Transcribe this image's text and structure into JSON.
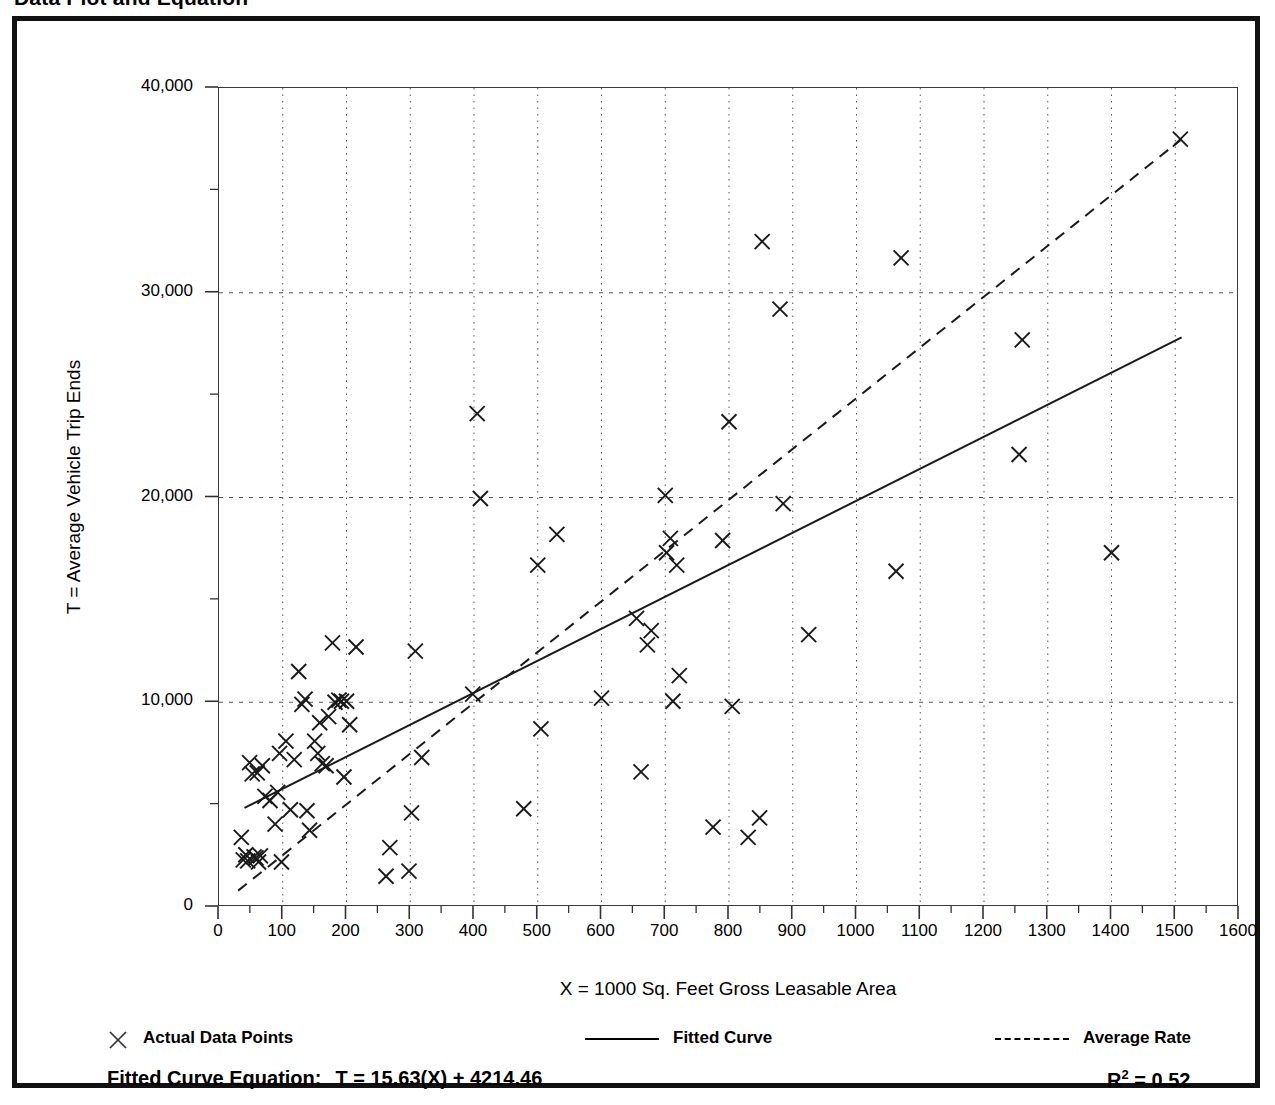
{
  "figure": {
    "title": "Data Plot and Equation"
  },
  "legend": [
    {
      "name": "actual-data-points",
      "label": "Actual Data Points",
      "swatch": "marker",
      "x": 0
    },
    {
      "name": "fitted-curve",
      "label": "Fitted Curve",
      "swatch": "solid",
      "x": 478
    },
    {
      "name": "average-rate",
      "label": "Average Rate",
      "swatch": "dashed",
      "x": 888
    }
  ],
  "equation": {
    "label": "Fitted Curve Equation:",
    "value": "T = 15.63(X) + 4214.46",
    "r_squared_symbol": "R",
    "r_squared_exponent": "2",
    "r_squared_value": "= 0.52"
  },
  "chart_data": {
    "type": "scatter",
    "title": "Data Plot and Equation",
    "xlabel": "X = 1000 Sq. Feet Gross Leasable Area",
    "ylabel": "T = Average Vehicle Trip Ends",
    "xlim": [
      0,
      1600
    ],
    "ylim": [
      0,
      40000
    ],
    "grid": true,
    "legend_position": "below-axis",
    "xticks": [
      0,
      100,
      200,
      300,
      400,
      500,
      600,
      700,
      800,
      900,
      1000,
      1100,
      1200,
      1300,
      1400,
      1500,
      1600
    ],
    "xtick_labels": [
      "0",
      "100",
      "200",
      "300",
      "400",
      "500",
      "600",
      "700",
      "800",
      "900",
      "1000",
      "1100",
      "1200",
      "1300",
      "1400",
      "1500",
      "1600"
    ],
    "xtick_minor_step": 50,
    "yticks": [
      0,
      10000,
      20000,
      30000,
      40000
    ],
    "ytick_labels": [
      "0",
      "10,000",
      "20,000",
      "30,000",
      "40,000"
    ],
    "ytick_minor_step": 5000,
    "series": [
      {
        "name": "Actual Data Points",
        "type": "scatter",
        "marker": "x",
        "color": "#1a1a1a",
        "points": [
          [
            35,
            3400
          ],
          [
            38,
            2300
          ],
          [
            42,
            2550
          ],
          [
            45,
            2250
          ],
          [
            48,
            7050
          ],
          [
            52,
            6500
          ],
          [
            55,
            2450
          ],
          [
            58,
            2400
          ],
          [
            60,
            6550
          ],
          [
            62,
            2200
          ],
          [
            65,
            2500
          ],
          [
            68,
            6900
          ],
          [
            72,
            5400
          ],
          [
            80,
            5200
          ],
          [
            88,
            4050
          ],
          [
            92,
            5600
          ],
          [
            95,
            7500
          ],
          [
            98,
            2200
          ],
          [
            105,
            8100
          ],
          [
            112,
            4750
          ],
          [
            118,
            7200
          ],
          [
            125,
            11500
          ],
          [
            130,
            9900
          ],
          [
            135,
            10150
          ],
          [
            138,
            4700
          ],
          [
            142,
            3750
          ],
          [
            150,
            8100
          ],
          [
            155,
            7500
          ],
          [
            158,
            9000
          ],
          [
            162,
            7000
          ],
          [
            168,
            6900
          ],
          [
            172,
            9300
          ],
          [
            178,
            12900
          ],
          [
            182,
            10000
          ],
          [
            188,
            10100
          ],
          [
            192,
            10050
          ],
          [
            196,
            6350
          ],
          [
            200,
            10050
          ],
          [
            205,
            8900
          ],
          [
            215,
            12700
          ],
          [
            262,
            1500
          ],
          [
            268,
            2900
          ],
          [
            298,
            1750
          ],
          [
            302,
            4600
          ],
          [
            308,
            12500
          ],
          [
            318,
            7300
          ],
          [
            398,
            10400
          ],
          [
            405,
            24100
          ],
          [
            410,
            19950
          ],
          [
            478,
            4800
          ],
          [
            500,
            16700
          ],
          [
            505,
            8700
          ],
          [
            530,
            18200
          ],
          [
            600,
            10200
          ],
          [
            655,
            14100
          ],
          [
            662,
            6600
          ],
          [
            672,
            12800
          ],
          [
            678,
            13500
          ],
          [
            700,
            20100
          ],
          [
            702,
            17300
          ],
          [
            708,
            18000
          ],
          [
            712,
            10050
          ],
          [
            718,
            16700
          ],
          [
            722,
            11300
          ],
          [
            775,
            3900
          ],
          [
            790,
            17900
          ],
          [
            800,
            23700
          ],
          [
            805,
            9800
          ],
          [
            830,
            3400
          ],
          [
            848,
            4350
          ],
          [
            852,
            32500
          ],
          [
            880,
            29200
          ],
          [
            885,
            19700
          ],
          [
            925,
            13300
          ],
          [
            1062,
            16400
          ],
          [
            1070,
            31700
          ],
          [
            1255,
            22100
          ],
          [
            1260,
            27700
          ],
          [
            1400,
            17300
          ],
          [
            1508,
            37500
          ]
        ]
      },
      {
        "name": "Fitted Curve",
        "type": "line",
        "style": "solid",
        "color": "#1a1a1a",
        "equation": "T = 15.63(X) + 4214.46",
        "slope": 15.63,
        "intercept": 4214.46,
        "r_squared": 0.52,
        "endpoints": [
          [
            40,
            4840
          ],
          [
            1510,
            27816
          ]
        ]
      },
      {
        "name": "Average Rate",
        "type": "line",
        "style": "dashed",
        "color": "#1a1a1a",
        "endpoints": [
          [
            30,
            800
          ],
          [
            1510,
            37500
          ]
        ]
      }
    ]
  }
}
